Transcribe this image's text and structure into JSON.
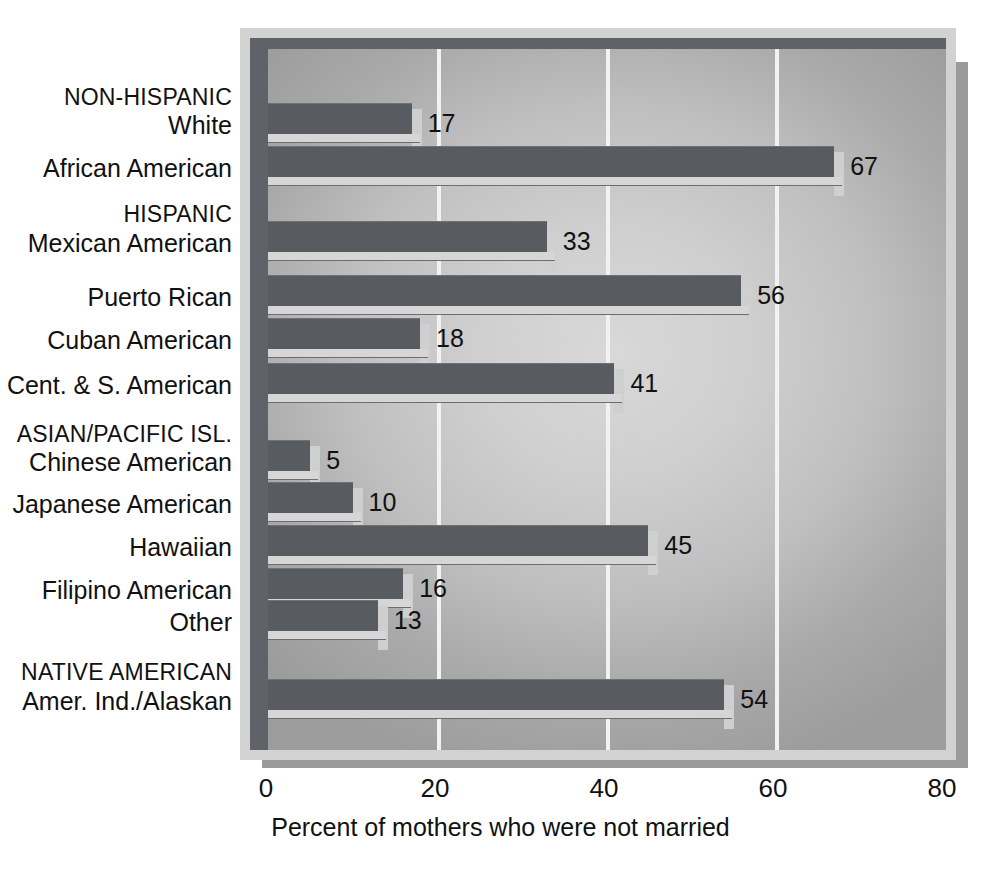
{
  "chart_data": {
    "type": "bar",
    "orientation": "horizontal",
    "title": "",
    "xlabel": "Percent of mothers who were not married",
    "ylabel": "",
    "xlim": [
      0,
      80
    ],
    "xticks": [
      0,
      20,
      40,
      60,
      80
    ],
    "xtick_labels": [
      "0",
      "20",
      "40",
      "60",
      "80"
    ],
    "grid": true,
    "legend": "none",
    "categories": [
      "White",
      "African American",
      "Mexican American",
      "Puerto Rican",
      "Cuban American",
      "Cent. & S. American",
      "Chinese American",
      "Japanese American",
      "Hawaiian",
      "Filipino American",
      "Other",
      "Amer. Ind./Alaskan"
    ],
    "values": [
      17,
      67,
      33,
      56,
      18,
      41,
      5,
      10,
      45,
      16,
      13,
      54
    ],
    "value_labels": [
      "17",
      "67",
      "33",
      "56",
      "18",
      "41",
      "5",
      "10",
      "45",
      "16",
      "13",
      "54"
    ],
    "group_headings": [
      "NON-HISPANIC",
      "HISPANIC",
      "ASIAN/PACIFIC ISL.",
      "NATIVE AMERICAN"
    ],
    "groups": [
      {
        "heading": "NON-HISPANIC",
        "categories": [
          "White",
          "African American"
        ],
        "values": [
          17,
          67
        ]
      },
      {
        "heading": "HISPANIC",
        "categories": [
          "Mexican American",
          "Puerto Rican",
          "Cuban American",
          "Cent. & S. American"
        ],
        "values": [
          33,
          56,
          18,
          41
        ]
      },
      {
        "heading": "ASIAN/PACIFIC ISL.",
        "categories": [
          "Chinese American",
          "Japanese American",
          "Hawaiian",
          "Filipino American",
          "Other"
        ],
        "values": [
          5,
          10,
          45,
          16,
          13
        ]
      },
      {
        "heading": "NATIVE AMERICAN",
        "categories": [
          "Amer. Ind./Alaskan"
        ],
        "values": [
          54
        ]
      }
    ]
  },
  "rows": [
    {
      "kind": "group",
      "label": "NON-HISPANIC",
      "top": 86
    },
    {
      "kind": "bar",
      "label": "White",
      "top": 113,
      "value": 17,
      "bar_top": 103,
      "bar_h": 40
    },
    {
      "kind": "bar",
      "label": "African American",
      "top": 156,
      "value": 67,
      "bar_top": 146,
      "bar_h": 40
    },
    {
      "kind": "group",
      "label": "HISPANIC",
      "top": 203
    },
    {
      "kind": "bar",
      "label": "Mexican American",
      "top": 231,
      "value": 33,
      "bar_top": 221,
      "bar_h": 40
    },
    {
      "kind": "bar",
      "label": "Puerto Rican",
      "top": 285,
      "value": 56,
      "bar_top": 275,
      "bar_h": 40
    },
    {
      "kind": "bar",
      "label": "Cuban American",
      "top": 328,
      "value": 18,
      "bar_top": 318,
      "bar_h": 40
    },
    {
      "kind": "bar",
      "label": "Cent. & S. American",
      "top": 373,
      "value": 41,
      "bar_top": 363,
      "bar_h": 40
    },
    {
      "kind": "group",
      "label": "ASIAN/PACIFIC ISL.",
      "top": 423
    },
    {
      "kind": "bar",
      "label": "Chinese American",
      "top": 450,
      "value": 5,
      "bar_top": 440,
      "bar_h": 40
    },
    {
      "kind": "bar",
      "label": "Japanese American",
      "top": 492,
      "value": 10,
      "bar_top": 482,
      "bar_h": 40
    },
    {
      "kind": "bar",
      "label": "Hawaiian",
      "top": 535,
      "value": 45,
      "bar_top": 525,
      "bar_h": 40
    },
    {
      "kind": "bar",
      "label": "Filipino American",
      "top": 578,
      "value": 16,
      "bar_top": 568,
      "bar_h": 40
    },
    {
      "kind": "bar",
      "label": "Other",
      "top": 610,
      "value": 13,
      "bar_top": 600,
      "bar_h": 40
    },
    {
      "kind": "group",
      "label": "NATIVE AMERICAN",
      "top": 661
    },
    {
      "kind": "bar",
      "label": "Amer. Ind./Alaskan",
      "top": 689,
      "value": 54,
      "bar_top": 679,
      "bar_h": 40
    }
  ],
  "colors": {
    "bar_fill": "#585b60",
    "bar_highlight": "#d6d6d6",
    "plot_light": "#d8d8d8",
    "plot_dark": "#9c9c9c",
    "frame": "#d2d2d2",
    "shadow": "#9a9a9a",
    "gridline": "#f2f2f2",
    "text": "#111111"
  },
  "axis": {
    "x_origin_px": 268,
    "px_per_unit": 8.45
  }
}
